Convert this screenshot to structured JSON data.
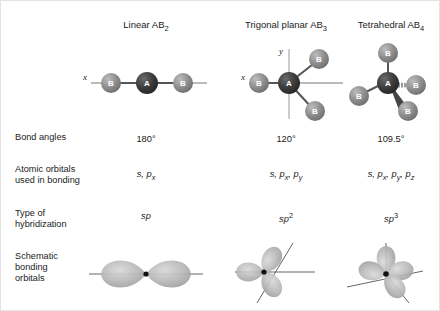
{
  "figure": {
    "columns": [
      {
        "key": "linear",
        "header_name": "Linear AB",
        "header_sub": "2",
        "bond_angle": "180°",
        "atomic_orbitals_plain": "s, p",
        "atomic_orbitals_sub": "x",
        "hybridization": "sp",
        "hybridization_sup": "",
        "axis_labels": [
          "x"
        ],
        "atom_center": "A",
        "atom_terminal": "B",
        "terminal_count": 3
      },
      {
        "key": "trigonal-planar",
        "header_name": "Trigonal planar AB",
        "header_sub": "3",
        "bond_angle": "120°",
        "atomic_orbitals_plain": "s, p",
        "atomic_orbitals_sub": "x",
        "atomic_orbitals_plain2": ", p",
        "atomic_orbitals_sub2": "y",
        "hybridization": "sp",
        "hybridization_sup": "2",
        "axis_labels": [
          "x",
          "y"
        ],
        "atom_center": "A",
        "atom_terminal": "B",
        "terminal_count": 3
      },
      {
        "key": "tetrahedral",
        "header_name": "Tetrahedral AB",
        "header_sub": "4",
        "bond_angle": "109.5°",
        "atomic_orbitals_plain": "s, p",
        "atomic_orbitals_sub": "x",
        "atomic_orbitals_plain2": ", p",
        "atomic_orbitals_sub2": "y",
        "atomic_orbitals_plain3": ", p",
        "atomic_orbitals_sub3": "z",
        "hybridization": "sp",
        "hybridization_sup": "3",
        "axis_labels": [],
        "atom_center": "A",
        "atom_terminal": "B",
        "terminal_count": 4
      }
    ],
    "row_labels": {
      "bond_angles": "Bond angles",
      "atomic_orbitals_line1": "Atomic orbitals",
      "atomic_orbitals_line2": "used in bonding",
      "hybridization_line1": "Type of",
      "hybridization_line2": "hybridization",
      "schematic_line1": "Schematic",
      "schematic_line2": "bonding",
      "schematic_line3": "orbitals"
    },
    "colors": {
      "atom_center_fill": "#3a3a3a",
      "atom_terminal_fill": "#8a8a8a",
      "atom_letter": "#ffffff",
      "bond_line": "#555555",
      "axis_line": "#777777",
      "orbital_lobe": "#b4b4b4",
      "orbital_node": "#111111",
      "background": "#ffffff",
      "text": "#1b1b1b"
    }
  }
}
